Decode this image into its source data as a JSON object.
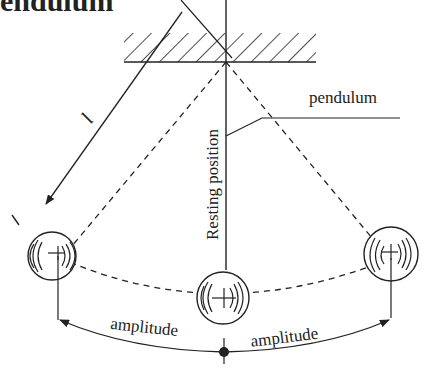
{
  "title": "endulum",
  "labels": {
    "length": "l",
    "pendulum": "pendulum",
    "resting_position": "Resting position",
    "amplitude_left": "amplitude",
    "amplitude_right": "amplitude"
  },
  "colors": {
    "line": "#222222",
    "background": "#ffffff"
  }
}
